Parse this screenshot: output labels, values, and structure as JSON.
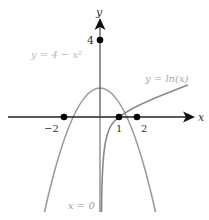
{
  "diagram": {
    "axes": {
      "x_label": "x",
      "y_label": "y"
    },
    "curves": [
      {
        "name": "parabola",
        "label": "y = 4 − x²",
        "equation": "y = 4 - x^2",
        "color": "#9a9a9a"
      },
      {
        "name": "logarithm",
        "label": "y = ln(x)",
        "equation": "y = ln(x)",
        "color": "#8a8a8a"
      }
    ],
    "asymptote": {
      "label": "x = 0"
    },
    "points": [
      {
        "label": "4",
        "x": 0,
        "y": 4
      },
      {
        "label": "−2",
        "x": -2,
        "y": 0
      },
      {
        "label": "1",
        "x": 1,
        "y": 0
      },
      {
        "label": "2",
        "x": 2,
        "y": 0
      }
    ],
    "colors": {
      "axis": "#222222",
      "curve": "#999999",
      "point": "#000000",
      "label_light": "#b0b0b0",
      "label_dark": "#333333"
    }
  }
}
